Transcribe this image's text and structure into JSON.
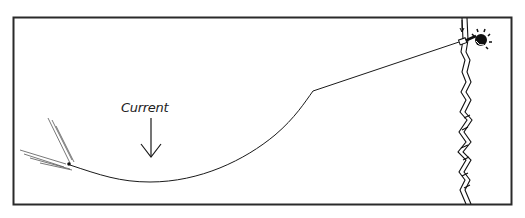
{
  "diagram": {
    "labels": {
      "current": "Current"
    },
    "elements": {
      "frame": "border",
      "line": "fishing-line",
      "rod": "fishing-rod",
      "angler": "angler-head",
      "bank": "river-bank",
      "lure": "lure-with-wake",
      "arrow": "current-direction-arrow"
    },
    "colors": {
      "ink": "#1a1a1a",
      "background": "#ffffff"
    }
  }
}
